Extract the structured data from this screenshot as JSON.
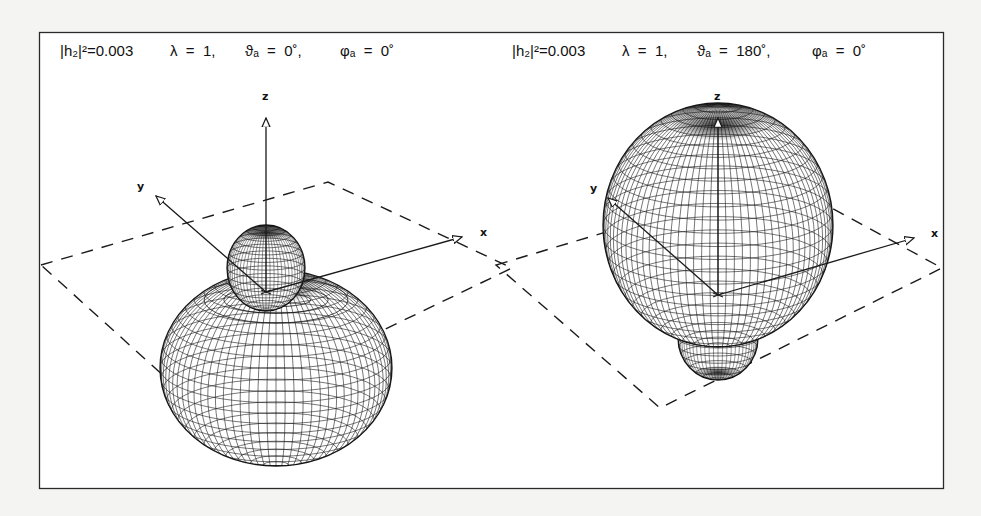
{
  "figure": {
    "panels": [
      {
        "id": "left",
        "caption": {
          "amplitude": "|h₂|²=0.003",
          "lambda": "λ  =  1,",
          "theta": "ϑₐ  =  0˚,",
          "phi": "φₐ  =  0˚"
        },
        "theta_a_deg": 0,
        "phi_a_deg": 0,
        "lambda": 1,
        "h2_squared": 0.003,
        "shape": "small upper lobe above large lower toroidal lobe",
        "axes": {
          "z": "z",
          "y": "y",
          "x": "x"
        }
      },
      {
        "id": "right",
        "caption": {
          "amplitude": "|h₂|²=0.003",
          "lambda": "λ  =  1,",
          "theta": "ϑₐ  =  180˚,",
          "phi": "φₐ  =  0˚"
        },
        "theta_a_deg": 180,
        "phi_a_deg": 0,
        "lambda": 1,
        "h2_squared": 0.003,
        "shape": "large upper lobe above small lower lobe",
        "axes": {
          "z": "z",
          "y": "y",
          "x": "x"
        }
      }
    ],
    "colors": {
      "ink": "#1a1a1a",
      "paper": "#ffffff",
      "background": "#f4f4f2"
    }
  }
}
